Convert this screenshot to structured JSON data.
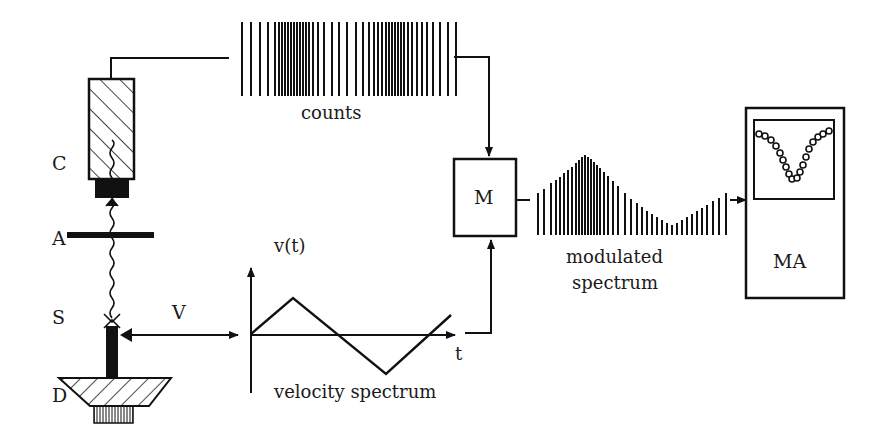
{
  "diagram": {
    "labels": {
      "counter": "C",
      "absorber": "A",
      "source": "S",
      "drive": "D",
      "velocity": "V",
      "counts": "counts",
      "modulator": "M",
      "modulated_line1": "modulated",
      "modulated_line2": "spectrum",
      "analyzer": "MA",
      "vt_axis": "v(t)",
      "t_axis": "t",
      "velocity_spectrum": "velocity spectrum"
    },
    "colors": {
      "ink": "#111111",
      "background": "#ffffff"
    },
    "components": [
      {
        "id": "C",
        "name": "counter (hatched detector)"
      },
      {
        "id": "A",
        "name": "absorber"
      },
      {
        "id": "S",
        "name": "source"
      },
      {
        "id": "D",
        "name": "drive"
      },
      {
        "id": "M",
        "name": "modulator box"
      },
      {
        "id": "MA",
        "name": "multichannel analyzer"
      }
    ],
    "connections": [
      [
        "C",
        "counts"
      ],
      [
        "counts",
        "M"
      ],
      [
        "velocity spectrum",
        "M"
      ],
      [
        "M",
        "modulated spectrum"
      ],
      [
        "modulated spectrum",
        "MA"
      ],
      [
        "S",
        "velocity spectrum"
      ]
    ]
  }
}
